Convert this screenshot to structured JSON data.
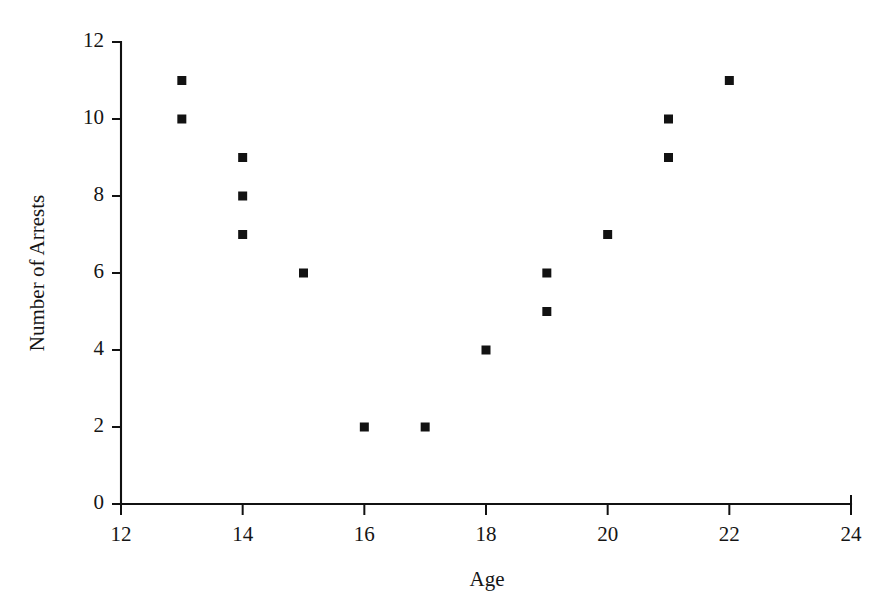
{
  "chart_data": {
    "type": "scatter",
    "title": "",
    "xlabel": "Age",
    "ylabel": "Number of Arrests",
    "xlim": [
      12,
      24
    ],
    "ylim": [
      0,
      12
    ],
    "xticks": [
      12,
      14,
      16,
      18,
      20,
      22,
      24
    ],
    "yticks": [
      0,
      2,
      4,
      6,
      8,
      10,
      12
    ],
    "grid": false,
    "legend": false,
    "marker": "square",
    "marker_color": "#121212",
    "points": [
      {
        "x": 13,
        "y": 11
      },
      {
        "x": 13,
        "y": 10
      },
      {
        "x": 14,
        "y": 9
      },
      {
        "x": 14,
        "y": 8
      },
      {
        "x": 14,
        "y": 7
      },
      {
        "x": 15,
        "y": 6
      },
      {
        "x": 16,
        "y": 2
      },
      {
        "x": 17,
        "y": 2
      },
      {
        "x": 18,
        "y": 4
      },
      {
        "x": 19,
        "y": 6
      },
      {
        "x": 19,
        "y": 5
      },
      {
        "x": 20,
        "y": 7
      },
      {
        "x": 21,
        "y": 10
      },
      {
        "x": 21,
        "y": 9
      },
      {
        "x": 22,
        "y": 11
      }
    ]
  },
  "axes": {
    "x_tick_labels": [
      "12",
      "14",
      "16",
      "18",
      "20",
      "22",
      "24"
    ],
    "y_tick_labels": [
      "0",
      "2",
      "4",
      "6",
      "8",
      "10",
      "12"
    ],
    "x_title": "Age",
    "y_title": "Number of Arrests"
  }
}
